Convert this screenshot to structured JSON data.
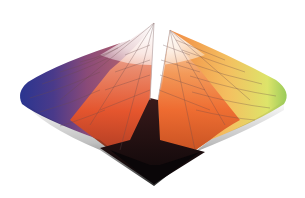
{
  "figure": {
    "background": "#ffffff",
    "geometry": {
      "top_apex": [
        154,
        23
      ],
      "bottom_apex": [
        154,
        183
      ],
      "left_extreme": [
        20,
        95
      ],
      "right_extreme": [
        288,
        95
      ],
      "center": [
        152,
        100
      ]
    },
    "colors": {
      "white_top": "#f6f4f6",
      "blue": "#2f3a8f",
      "violet": "#6a4a8a",
      "magenta": "#b2506a",
      "red_orange": "#e8552a",
      "orange": "#f07a35",
      "yellow_orange": "#f5b85a",
      "yellow": "#eae46a",
      "yellow_green": "#c8e07a",
      "green": "#8cc060",
      "black_bottom": "#120a10",
      "grid_line": "#7a5a4a"
    }
  }
}
